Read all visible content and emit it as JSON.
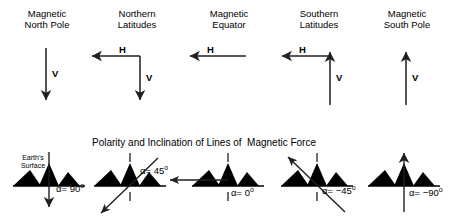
{
  "diagram": {
    "section_title": "Polarity and Inclination of Lines of  Magnetic Force",
    "surface_label": "Earth's\nSurface",
    "columns": [
      {
        "title": "Magnetic\nNorth Pole",
        "vertical_label": "V",
        "horizontal_label": "",
        "vertical_direction": "down",
        "horizontal_direction": "none",
        "alpha_value": "90",
        "alpha_text": "α= 90",
        "degree_symbol": "o",
        "field_direction": "down"
      },
      {
        "title": "Northern\nLatitudes",
        "vertical_label": "V",
        "horizontal_label": "H",
        "vertical_direction": "down",
        "horizontal_direction": "left",
        "alpha_value": "45",
        "alpha_text": "α= 45",
        "degree_symbol": "o",
        "field_direction": "down-left"
      },
      {
        "title": "Magnetic\nEquator",
        "vertical_label": "",
        "horizontal_label": "H",
        "vertical_direction": "none",
        "horizontal_direction": "left",
        "alpha_value": "0",
        "alpha_text": "α= 0",
        "degree_symbol": "o",
        "field_direction": "left"
      },
      {
        "title": "Southern\nLatitudes",
        "vertical_label": "V",
        "horizontal_label": "H",
        "vertical_direction": "up",
        "horizontal_direction": "left",
        "alpha_value": "-45",
        "alpha_text": "α= −45",
        "degree_symbol": "o",
        "field_direction": "up-left"
      },
      {
        "title": "Magnetic\nSouth Pole",
        "vertical_label": "V",
        "horizontal_label": "",
        "vertical_direction": "up",
        "horizontal_direction": "none",
        "alpha_value": "-90",
        "alpha_text": "α= −90",
        "degree_symbol": "o",
        "field_direction": "up"
      }
    ],
    "colors": {
      "stroke": "#231f20",
      "terrain": "#000000",
      "background": "#ffffff"
    }
  }
}
